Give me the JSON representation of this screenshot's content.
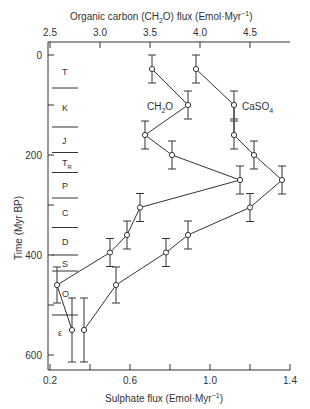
{
  "chart_data": {
    "type": "line",
    "title": "",
    "top_axis": {
      "label": "Organic carbon (CH2O) flux (Emol·Myr⁻¹)",
      "ticks": [
        "2.5",
        "3.0",
        "3.5",
        "4.0",
        "4.5"
      ],
      "range": [
        2.5,
        4.8
      ]
    },
    "bottom_axis": {
      "label": "Sulphate flux (Emol·Myr⁻¹)",
      "ticks": [
        "0.2",
        "0.6",
        "1.0",
        "1.4"
      ],
      "range": [
        0.2,
        1.4
      ]
    },
    "ylabel": "Time (Myr BP)",
    "y_ticks": [
      "0",
      "200",
      "400",
      "600"
    ],
    "ylim": [
      0,
      620
    ],
    "periods": [
      "T",
      "K",
      "J",
      "TR",
      "P",
      "C",
      "D",
      "S",
      "O",
      "ε"
    ],
    "series": [
      {
        "name": "CH2O",
        "axis": "top",
        "time": [
          28,
          100,
          160,
          200,
          250,
          305,
          360,
          395,
          460,
          550
        ],
        "values": [
          3.52,
          3.88,
          3.45,
          3.72,
          4.4,
          3.4,
          3.27,
          3.1,
          2.57,
          2.72
        ]
      },
      {
        "name": "CaSO4",
        "axis": "bottom",
        "time": [
          28,
          100,
          160,
          200,
          250,
          305,
          360,
          395,
          460,
          550
        ],
        "values": [
          0.93,
          1.12,
          1.12,
          1.22,
          1.36,
          1.2,
          0.89,
          0.78,
          0.53,
          0.37
        ]
      }
    ]
  },
  "labels": {
    "top_title": "Organic carbon (CH",
    "top_title_sub": "2",
    "top_title_end": "O) flux (Emol·Myr",
    "bottom_title": "Sulphate flux (Emol·Myr",
    "sup": "−1",
    "close": ")",
    "ylabel": "Time (Myr BP)",
    "series_ch2o": "CH",
    "series_ch2o_sub": "2",
    "series_ch2o_end": "O",
    "series_caso4": "CaSO",
    "series_caso4_sub": "4"
  }
}
